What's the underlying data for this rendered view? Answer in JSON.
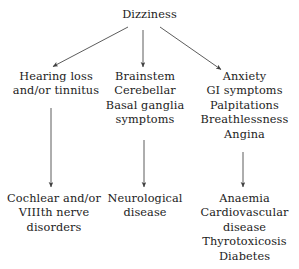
{
  "diagram": {
    "title": "Dizziness",
    "style": {
      "text_color": "#1c1c1c",
      "line_color": "#4a4a4a",
      "background": "#ffffff"
    },
    "root": {
      "label": "Dizziness",
      "lines": [
        "Dizziness"
      ]
    },
    "branches": [
      {
        "id": "hearing",
        "symptom_lines": [
          "Hearing loss",
          "and/or tinnitus"
        ],
        "outcome_lines": [
          "Cochlear and/or",
          "VIIIth nerve",
          "disorders"
        ]
      },
      {
        "id": "brainstem",
        "symptom_lines": [
          "Brainstem",
          "Cerebellar",
          "Basal ganglia",
          "symptoms"
        ],
        "outcome_lines": [
          "Neurological",
          "disease"
        ]
      },
      {
        "id": "anxiety",
        "symptom_lines": [
          "Anxiety",
          "GI symptoms",
          "Palpitations",
          "Breathlessness",
          "Angina"
        ],
        "outcome_lines": [
          "Anaemia",
          "Cardiovascular",
          "disease",
          "Thyrotoxicosis",
          "Diabetes"
        ]
      }
    ],
    "arrows": [
      {
        "name": "arrow-root-to-hearing",
        "from": [
          128,
          27
        ],
        "to": [
          52,
          67
        ]
      },
      {
        "name": "arrow-root-to-brainstem",
        "from": [
          143,
          30
        ],
        "to": [
          143,
          68
        ]
      },
      {
        "name": "arrow-root-to-anxiety",
        "from": [
          160,
          27
        ],
        "to": [
          222,
          70
        ]
      },
      {
        "name": "arrow-hearing-to-cochlear",
        "from": [
          51,
          108
        ],
        "to": [
          51,
          188
        ]
      },
      {
        "name": "arrow-brainstem-to-neuro",
        "from": [
          144,
          140
        ],
        "to": [
          144,
          188
        ]
      },
      {
        "name": "arrow-anxiety-to-anaemia",
        "from": [
          243,
          152
        ],
        "to": [
          243,
          188
        ]
      }
    ]
  }
}
